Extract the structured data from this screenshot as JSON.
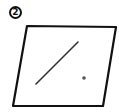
{
  "figure": {
    "label": "2",
    "elements": [
      {
        "type": "plane",
        "description": "parallelogram representing a plane"
      },
      {
        "type": "line-segment",
        "description": "line segment lying in the plane"
      },
      {
        "type": "point",
        "description": "point in the plane, not on the line"
      }
    ],
    "stroke_color": "#111111",
    "point_color": "#555555"
  }
}
